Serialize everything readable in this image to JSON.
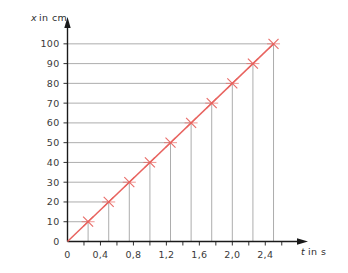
{
  "chart_data": {
    "type": "line",
    "title": "",
    "subtitle": "",
    "xlabel": "t in s",
    "ylabel": "x in cm",
    "xlabel_symbol": "t",
    "xlabel_rest": "in s",
    "ylabel_symbol": "x",
    "ylabel_rest": "in  cm",
    "x": [
      0.25,
      0.5,
      0.75,
      1.0,
      1.25,
      1.5,
      1.75,
      2.0,
      2.25,
      2.5
    ],
    "values": [
      10,
      20,
      30,
      40,
      50,
      60,
      70,
      80,
      90,
      100
    ],
    "series": [
      {
        "name": "x(t)",
        "x": [
          0.25,
          0.5,
          0.75,
          1.0,
          1.25,
          1.5,
          1.75,
          2.0,
          2.25,
          2.5
        ],
        "values": [
          10,
          20,
          30,
          40,
          50,
          60,
          70,
          80,
          90,
          100
        ],
        "color": "#e8635f",
        "marker": "x",
        "line_style": "solid"
      }
    ],
    "xlim": [
      0,
      2.7
    ],
    "ylim": [
      0,
      107
    ],
    "xticks": [
      0,
      0.2,
      0.4,
      0.6,
      0.8,
      1.0,
      1.2,
      1.4,
      1.6,
      1.8,
      2.0,
      2.2,
      2.4,
      2.6
    ],
    "xtick_labels": [
      "0",
      "",
      "0,4",
      "",
      "0,8",
      "",
      "1,2",
      "",
      "1,6",
      "",
      "2,0",
      "",
      "2,4",
      ""
    ],
    "yticks": [
      0,
      10,
      20,
      30,
      40,
      50,
      60,
      70,
      80,
      90,
      100
    ],
    "ytick_labels": [
      "0",
      "10",
      "20",
      "30",
      "40",
      "50",
      "60",
      "70",
      "80",
      "90",
      "100"
    ],
    "grid": false,
    "guide_lines": true,
    "legend": null,
    "legend_position": "none",
    "annotations": [],
    "slope_cm_per_s": 40,
    "colors": {
      "data_line": "#e8635f",
      "marker": "#e8635f",
      "axis": "#1a1a1a",
      "guide_line": "#8a8a8a",
      "tick_text": "#3a3a3a",
      "background": "#ffffff"
    }
  }
}
